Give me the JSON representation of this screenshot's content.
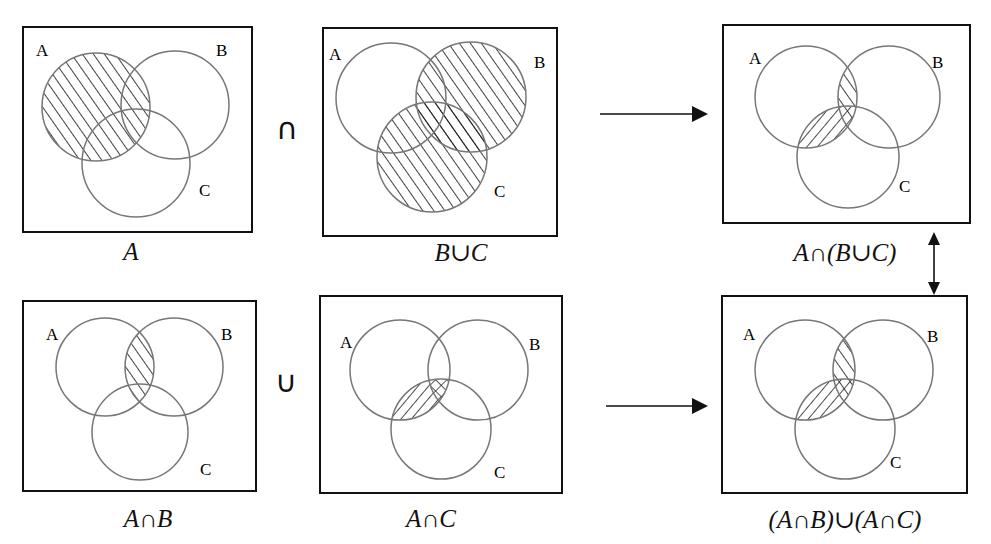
{
  "colors": {
    "border": "#111111",
    "circle": "#777777",
    "hatch": "#111111",
    "background": "#ffffff"
  },
  "operators": {
    "intersection": "∩",
    "union": "∪"
  },
  "panels": [
    {
      "id": "A",
      "caption": "A",
      "labels": {
        "a": "A",
        "b": "B",
        "c": "C"
      },
      "shaded": "A"
    },
    {
      "id": "BuC",
      "caption": "B∪C",
      "labels": {
        "a": "A",
        "b": "B",
        "c": "C"
      },
      "shaded": "B ∪ C"
    },
    {
      "id": "An(BuC)",
      "caption": "A∩(B∪C)",
      "labels": {
        "a": "A",
        "b": "B",
        "c": "C"
      },
      "shaded": "A ∩ (B ∪ C)"
    },
    {
      "id": "AnB",
      "caption": "A∩B",
      "labels": {
        "a": "A",
        "b": "B",
        "c": "C"
      },
      "shaded": "A ∩ B"
    },
    {
      "id": "AnC",
      "caption": "A∩C",
      "labels": {
        "a": "A",
        "b": "B",
        "c": "C"
      },
      "shaded": "A ∩ C (crosshatch where overlapping A∩B)"
    },
    {
      "id": "(AnB)u(AnC)",
      "caption": "(A∩B)∪(A∩C)",
      "labels": {
        "a": "A",
        "b": "B",
        "c": "C"
      },
      "shaded": "(A ∩ B) ∪ (A ∩ C)"
    }
  ],
  "arrows": [
    {
      "from": "BuC",
      "to": "An(BuC)",
      "type": "right-arrow"
    },
    {
      "from": "AnC",
      "to": "(AnB)u(AnC)",
      "type": "right-arrow"
    },
    {
      "from": "An(BuC)",
      "to": "(AnB)u(AnC)",
      "type": "double-arrow",
      "meaning": "equal"
    }
  ]
}
